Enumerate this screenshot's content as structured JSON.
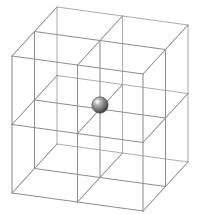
{
  "figure": {
    "type": "3d-wireframe-lattice",
    "background_color": "#ffffff",
    "canvas": {
      "width": 197,
      "height": 214
    }
  },
  "lattice": {
    "name": "wireframe-cube-lattice",
    "divisions_x": 2,
    "divisions_y": 2,
    "divisions_z": 2,
    "total_subcubes": 8,
    "edge_color": "#8f8f8f",
    "edge_width": 1.05,
    "projection": {
      "origin": [
        12,
        56
      ],
      "axis_x": [
        65.5,
        9.0
      ],
      "axis_y": [
        22.5,
        -24.5
      ],
      "axis_z": [
        0,
        68.5
      ],
      "note": "axis vectors are per one lattice division in screen pixels"
    }
  },
  "atom": {
    "name": "center-sphere",
    "label": "central atom",
    "center": [
      100,
      105
    ],
    "radius": 8.2,
    "base_color": "#808080",
    "shadow_color": "#3d3d3d",
    "highlight_color": "#e8e8e8",
    "highlight_offset": [
      -2.6,
      -3.0
    ],
    "position_fractional": [
      0.5,
      0.5,
      0.5
    ]
  },
  "chart_data": {
    "type": "scatter",
    "xlabel": "",
    "ylabel": "",
    "series": [
      {
        "name": "central atom",
        "points": [
          {
            "x": 1,
            "y": 1,
            "z": 1
          }
        ]
      }
    ],
    "grid": true,
    "legend": "none",
    "axis_ranges": {
      "x": [
        0,
        2
      ],
      "y": [
        0,
        2
      ],
      "z": [
        0,
        2
      ]
    }
  }
}
